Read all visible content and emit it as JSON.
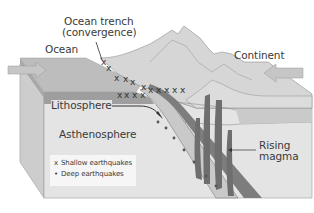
{
  "diagram": {
    "type": "subduction-zone cross-section",
    "labels": {
      "trench_line1": "Ocean trench",
      "trench_line2": "(convergence)",
      "ocean": "Ocean",
      "continent": "Continent",
      "lithosphere": "Lithosphere",
      "asthenosphere": "Asthenosphere",
      "rising_line1": "Rising",
      "rising_line2": "magma"
    },
    "legend": {
      "items": [
        {
          "symbol": "x",
          "label": "Shallow earthquakes"
        },
        {
          "symbol": "•",
          "label": "Deep earthquakes"
        }
      ]
    },
    "colors": {
      "sky": "#ffffff",
      "ocean_surface": "#b9b9b9",
      "crust_light": "#d3d3d3",
      "block_front": "#e2e2e2",
      "block_side": "#cfcfcf",
      "slab": "#8a8a8a",
      "magma": "#6a6a6a",
      "arrow_fill": "#c4c4c4",
      "text": "#3a3a3a"
    }
  }
}
